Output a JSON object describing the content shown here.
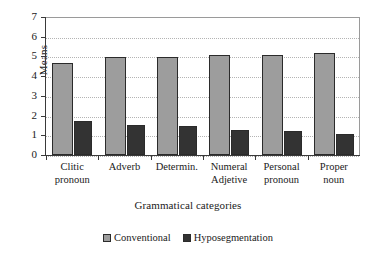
{
  "chart_data": {
    "type": "bar",
    "title": "",
    "xlabel": "Grammatical categories",
    "ylabel": "Means",
    "ylim": [
      0,
      7
    ],
    "ytick_step": 1,
    "yticks": [
      0,
      1,
      2,
      3,
      4,
      5,
      6,
      7
    ],
    "grid": true,
    "grid_style": "dotted-horizontal",
    "legend_position": "bottom-center",
    "categories": [
      "Clitic\npronoun",
      "Adverb",
      "Determin.",
      "Numeral\nAdjetive",
      "Personal\npronoun",
      "Proper\nnoun"
    ],
    "series": [
      {
        "name": "Conventional",
        "color": "#9d9d9d",
        "values": [
          4.65,
          4.95,
          4.95,
          5.05,
          5.05,
          5.15
        ]
      },
      {
        "name": "Hyposegmentation",
        "color": "#333333",
        "values": [
          1.75,
          1.5,
          1.45,
          1.28,
          1.22,
          1.05
        ]
      }
    ]
  },
  "axes": {
    "y_title": "Means",
    "x_title": "Grammatical categories",
    "y_tick_labels": [
      "0",
      "1",
      "2",
      "3",
      "4",
      "5",
      "6",
      "7"
    ]
  },
  "legend": {
    "items": [
      {
        "label": "Conventional",
        "color": "#9d9d9d"
      },
      {
        "label": "Hyposegmentation",
        "color": "#333333"
      }
    ]
  },
  "colors": {
    "conventional": "#9d9d9d",
    "hyposegmentation": "#333333",
    "axis": "#3a3a3a",
    "grid": "#b4b4b4",
    "background": "#ffffff"
  }
}
